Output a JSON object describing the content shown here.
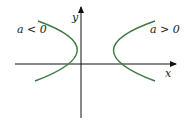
{
  "diagram": {
    "axes": {
      "x_label": "x",
      "y_label": "y"
    },
    "curves": [
      {
        "label": "a < 0",
        "opens": "left",
        "color": "#3a7a3f"
      },
      {
        "label": "a > 0",
        "opens": "right",
        "color": "#3a7a3f"
      }
    ],
    "colors": {
      "axis": "#111111",
      "curve": "#3a7a3f",
      "background": "#ffffff"
    }
  }
}
